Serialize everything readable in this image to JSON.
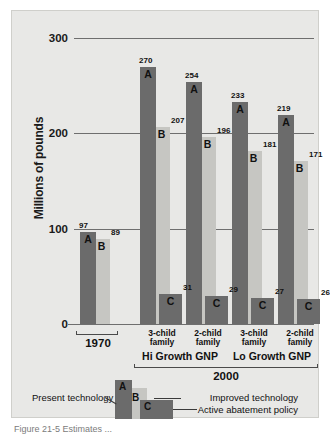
{
  "figure": {
    "caption": "Figure 21-5   Estimates ..."
  },
  "chart_data": {
    "type": "bar",
    "title": "",
    "xlabel": "",
    "ylabel": "Millions of pounds",
    "ylim": [
      0,
      320
    ],
    "yticks": [
      0,
      100,
      200,
      300
    ],
    "ytick_labels": [
      "0",
      "100",
      "200",
      "300"
    ],
    "grid": true,
    "legend_position": "bottom",
    "categories": [
      "1970",
      "3-child family",
      "2-child family",
      "3-child family",
      "2-child family"
    ],
    "category_lines": [
      [
        "1970"
      ],
      [
        "3-child",
        "family"
      ],
      [
        "2-child",
        "family"
      ],
      [
        "3-child",
        "family"
      ],
      [
        "2-child",
        "family"
      ]
    ],
    "super_groups": [
      {
        "label": "Hi Growth GNP",
        "members": [
          1,
          2
        ]
      },
      {
        "label": "Lo Growth GNP",
        "members": [
          3,
          4
        ]
      }
    ],
    "eras": [
      {
        "label": "1970",
        "members": [
          0
        ]
      },
      {
        "label": "2000",
        "members": [
          1,
          2,
          3,
          4
        ]
      }
    ],
    "series": [
      {
        "name": "A",
        "label": "Present technology",
        "color": "#6b6b6b",
        "values": [
          97,
          270,
          254,
          233,
          219
        ]
      },
      {
        "name": "B",
        "label": "Improved technology",
        "color": "#c6c6c2",
        "values": [
          89,
          207,
          196,
          181,
          171
        ]
      },
      {
        "name": "C",
        "label": "Active abatement policy",
        "color": "#6b6b6b",
        "values": [
          null,
          31,
          29,
          27,
          26
        ]
      }
    ]
  },
  "legend": {
    "items": [
      {
        "key": "A",
        "label": "Present technology"
      },
      {
        "key": "B",
        "label": "Improved technology"
      },
      {
        "key": "C",
        "label": "Active abatement policy"
      }
    ]
  }
}
